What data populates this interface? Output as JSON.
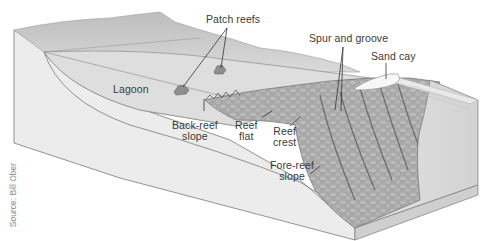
{
  "diagram": {
    "style": "grayscale 3D block cross-section",
    "colors": {
      "background": "#ffffff",
      "land": "#cfcfcf",
      "lagoon": "#e2e2e2",
      "block_side": "#ececec",
      "reef": "#a9a9a9",
      "reef_dark": "#7d7d7d",
      "sand": "#f7f7f7",
      "ocean_face": "#bdbdbd",
      "outline": "#707070",
      "label_text": "#3a3a3a",
      "leader_line": "#333333"
    },
    "labels": [
      {
        "id": "patch-reefs",
        "text": "Patch reefs"
      },
      {
        "id": "spur-and-groove",
        "text": "Spur and groove"
      },
      {
        "id": "sand-cay",
        "text": "Sand cay"
      },
      {
        "id": "lagoon",
        "text": "Lagoon"
      },
      {
        "id": "back-reef-slope",
        "line1": "Back-reef",
        "line2": "slope"
      },
      {
        "id": "reef-flat",
        "line1": "Reef",
        "line2": "flat"
      },
      {
        "id": "reef-crest",
        "line1": "Reef",
        "line2": "crest"
      },
      {
        "id": "fore-reef-slope",
        "line1": "Fore-reef",
        "line2": "slope"
      }
    ],
    "credit": "Source: Bill Ober"
  }
}
